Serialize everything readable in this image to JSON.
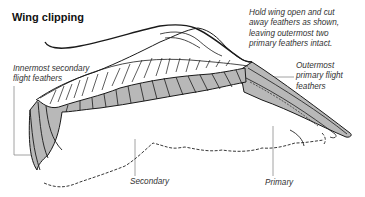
{
  "diagram": {
    "title": "Wing clipping",
    "instruction": "Hold wing open and cut\naway feathers as shown,\nleaving outermost two\nprimary feathers intact.",
    "labels": {
      "innermost_secondary": "Innermost secondary\nflight feathers",
      "outermost_primary": "Outermost\nprimary flight\nfeathers",
      "secondary": "Secondary",
      "primary": "Primary"
    },
    "colors": {
      "line": "#1a1a1a",
      "clipped_fill": "#b8b8b8",
      "leader": "#888888",
      "text": "#333333"
    }
  }
}
